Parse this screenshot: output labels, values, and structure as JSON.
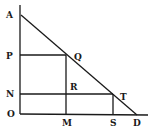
{
  "diagram": {
    "type": "geometry",
    "points": {
      "A": {
        "label": "A",
        "x": 21,
        "y": 15
      },
      "P": {
        "label": "P",
        "x": 20,
        "y": 55
      },
      "Q": {
        "label": "Q",
        "x": 66,
        "y": 55
      },
      "N": {
        "label": "N",
        "x": 20,
        "y": 94
      },
      "R": {
        "label": "R",
        "x": 66,
        "y": 94
      },
      "T": {
        "label": "T",
        "x": 113,
        "y": 94
      },
      "O": {
        "label": "O",
        "x": 20,
        "y": 114
      },
      "M": {
        "label": "M",
        "x": 66,
        "y": 114
      },
      "S": {
        "label": "S",
        "x": 113,
        "y": 114
      },
      "D": {
        "label": "D",
        "x": 137,
        "y": 114
      }
    },
    "segments": [
      [
        "A",
        "D"
      ],
      [
        "O",
        "A"
      ],
      [
        "O",
        "D"
      ],
      [
        "P",
        "Q"
      ],
      [
        "Q",
        "M"
      ],
      [
        "N",
        "T"
      ],
      [
        "T",
        "S"
      ]
    ],
    "labels": {
      "A": "A",
      "P": "P",
      "N": "N",
      "O": "O",
      "Q": "Q",
      "R": "R",
      "T": "T",
      "M": "M",
      "S": "S",
      "D": "D"
    },
    "colors": {
      "stroke": "#1a1a1a",
      "background": "#ffffff"
    }
  }
}
